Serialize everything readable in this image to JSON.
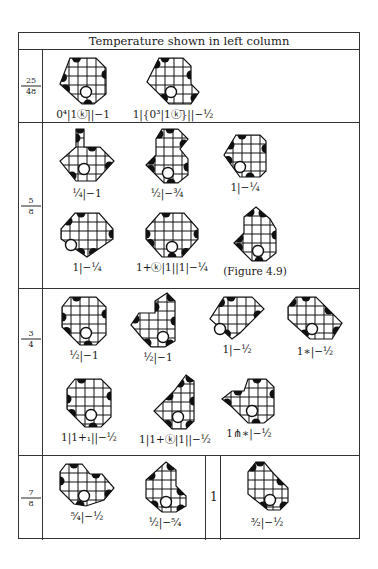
{
  "table": {
    "header": "Temperature shown in left column",
    "rows": [
      {
        "temperature": {
          "num": "25",
          "den": "48"
        },
        "positions": [
          {
            "label": "0⁴|1ⓚ̄||−1",
            "x": 40,
            "y": 6
          },
          {
            "label": "1|{0³|1ⓚ̄}||−½",
            "x": 116,
            "y": 6
          }
        ]
      },
      {
        "temperature": {
          "num": "5",
          "den": "8"
        },
        "positions": [
          {
            "label": "¼|−1",
            "x": 40,
            "y": 3
          },
          {
            "label": "½|−¾",
            "x": 118,
            "y": 3
          },
          {
            "label": "1|−¼",
            "x": 190,
            "y": 8
          },
          {
            "label": "1|−¼",
            "x": 40,
            "y": 86
          },
          {
            "label": "1+ⓚ|1||1|−¼",
            "x": 116,
            "y": 86
          },
          {
            "label": "(Figure 4.9)",
            "x": 196,
            "y": 86
          }
        ]
      },
      {
        "temperature": {
          "num": "3",
          "den": "4"
        },
        "positions": [
          {
            "label": "½|−1",
            "x": 40,
            "y": 4
          },
          {
            "label": "½|−1",
            "x": 112,
            "y": 2
          },
          {
            "label": "1|−½",
            "x": 186,
            "y": 4
          },
          {
            "label": "1∗|−½",
            "x": 262,
            "y": 4
          },
          {
            "label": "1|1+₁||−½",
            "x": 40,
            "y": 86
          },
          {
            "label": "1|1+ⓚ|1||−½",
            "x": 112,
            "y": 84
          },
          {
            "label": "1⋔∗|−½",
            "x": 190,
            "y": 86
          }
        ]
      },
      {
        "temperature": {
          "num": "7",
          "den": "8"
        },
        "positions": [
          {
            "label": "⁵⁄₄|−½",
            "x": 32,
            "y": 4
          },
          {
            "label": "½|−⁵⁄₄",
            "x": 112,
            "y": 2
          },
          {
            "label": "³⁄₂|−½",
            "x": 210,
            "y": 2
          }
        ],
        "split_label": "1"
      }
    ]
  }
}
